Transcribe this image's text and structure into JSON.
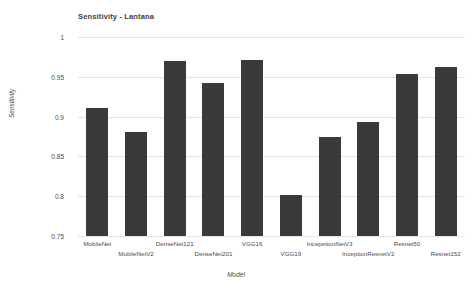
{
  "chart_data": {
    "type": "bar",
    "title": "Sensitivity - Lantana",
    "xlabel": "Model",
    "ylabel": "Sensitivity",
    "ylim": [
      0.75,
      1.0
    ],
    "yticks": [
      "0.75",
      "0.8",
      "0.85",
      "0.9",
      "0.95",
      "1"
    ],
    "ytick_values": [
      0.75,
      0.8,
      0.85,
      0.9,
      0.95,
      1.0
    ],
    "grid": true,
    "legend": "none",
    "bar_color": "#3a3a3a",
    "categories": [
      "MobileNet",
      "MobileNetV2",
      "DenseNet121",
      "DenseNet201",
      "VGG16",
      "VGG19",
      "IncepetionNetV3",
      "InceptionResnetV2",
      "Resnet50",
      "Resnet152"
    ],
    "values": [
      0.911,
      0.881,
      0.97,
      0.942,
      0.971,
      0.802,
      0.875,
      0.893,
      0.953,
      0.962
    ]
  }
}
